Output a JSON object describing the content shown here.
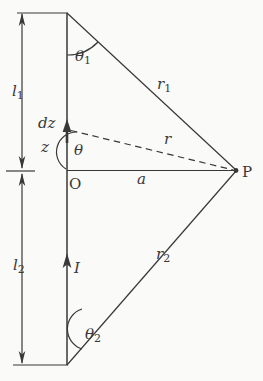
{
  "colors": {
    "ink": "#383838",
    "paper": "#fafaf8"
  },
  "labels": {
    "l1": {
      "base": "l",
      "sub": "1"
    },
    "l2": {
      "base": "l",
      "sub": "2"
    },
    "theta1": {
      "base": "θ",
      "sub": "1"
    },
    "theta2": {
      "base": "θ",
      "sub": "2"
    },
    "r1": {
      "base": "r",
      "sub": "1"
    },
    "r2": {
      "base": "r",
      "sub": "2"
    },
    "r": "r",
    "dz": "dz",
    "z": "z",
    "theta": "θ",
    "origin": "O",
    "a": "a",
    "current": "I",
    "point_p": "P"
  }
}
